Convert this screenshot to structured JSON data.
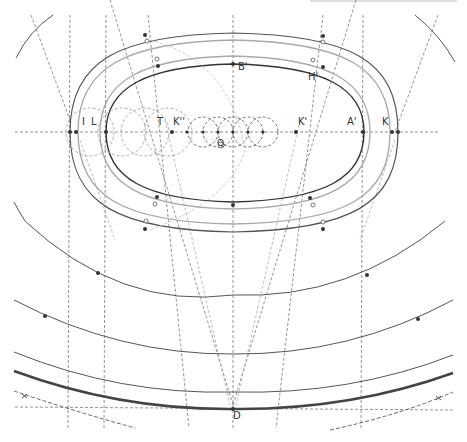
{
  "diagram": {
    "type": "geometric-construction",
    "colors": {
      "background": "#ffffff",
      "curve_dark": "#444444",
      "curve_light": "#aaaaaa",
      "construction": "#777777",
      "construction_light": "#bbbbbb",
      "point": "#333333"
    },
    "labels": {
      "I": "I",
      "L": "L",
      "T": "T",
      "K2": "K''",
      "Q": "Q",
      "K1": "K'",
      "A1": "A'",
      "K": "K",
      "B1": "B'",
      "H1": "H'",
      "D": "D"
    }
  }
}
